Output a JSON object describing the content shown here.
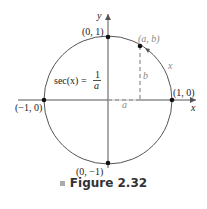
{
  "figure": {
    "caption": "Figure 2.32",
    "axes": {
      "x_label": "x",
      "y_label": "y"
    },
    "points": {
      "top": "(0, 1)",
      "right": "(1, 0)",
      "left": "(−1, 0)",
      "bottom": "(0, −1)",
      "ab": "(a, b)"
    },
    "segment_labels": {
      "a": "a",
      "b": "b",
      "arc": "x"
    },
    "formula": {
      "lhs": "sec(x) = ",
      "numerator": "1",
      "denominator": "a"
    },
    "colors": {
      "circle": "#555555",
      "axes": "#555555",
      "gray_label": "#888888"
    }
  }
}
